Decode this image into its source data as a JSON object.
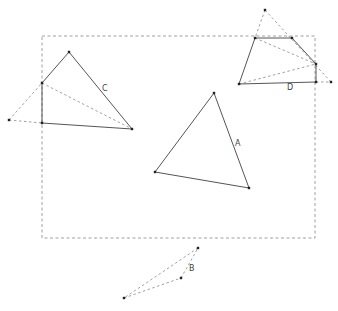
{
  "diagram": {
    "frame": {
      "x": 42,
      "y": 36,
      "width": 273,
      "height": 202
    },
    "shapes": [
      {
        "id": "A",
        "label": "A",
        "label_pos": [
          235,
          146
        ],
        "solid_edges": [
          [
            [
              214,
              93
            ],
            [
              155,
              172
            ]
          ],
          [
            [
              155,
              172
            ],
            [
              249,
              188
            ]
          ],
          [
            [
              249,
              188
            ],
            [
              214,
              93
            ]
          ]
        ],
        "dashed_edges": [],
        "points": [
          [
            214,
            93
          ],
          [
            155,
            172
          ],
          [
            249,
            188
          ]
        ]
      },
      {
        "id": "B",
        "label": "B",
        "label_pos": [
          189,
          271
        ],
        "solid_edges": [],
        "dashed_edges": [
          [
            [
              198,
              248
            ],
            [
              124,
              298
            ]
          ],
          [
            [
              124,
              298
            ],
            [
              181,
              278
            ]
          ],
          [
            [
              181,
              278
            ],
            [
              198,
              248
            ]
          ]
        ],
        "points": [
          [
            198,
            248
          ],
          [
            181,
            278
          ],
          [
            124,
            298
          ]
        ]
      },
      {
        "id": "C",
        "label": "C",
        "label_pos": [
          102,
          91
        ],
        "solid_edges": [
          [
            [
              42,
              83
            ],
            [
              69,
              52
            ]
          ],
          [
            [
              69,
              52
            ],
            [
              132,
              129
            ]
          ],
          [
            [
              132,
              129
            ],
            [
              42,
              123
            ]
          ],
          [
            [
              42,
              123
            ],
            [
              42,
              83
            ]
          ]
        ],
        "dashed_edges": [
          [
            [
              9,
              120
            ],
            [
              42,
              83
            ]
          ],
          [
            [
              9,
              120
            ],
            [
              42,
              123
            ]
          ],
          [
            [
              42,
              83
            ],
            [
              132,
              129
            ]
          ]
        ],
        "points": [
          [
            69,
            52
          ],
          [
            42,
            83
          ],
          [
            42,
            123
          ],
          [
            132,
            129
          ],
          [
            9,
            120
          ]
        ]
      },
      {
        "id": "D",
        "label": "D",
        "label_pos": [
          287,
          90
        ],
        "solid_edges": [
          [
            [
              255,
              38
            ],
            [
              292,
              38
            ]
          ],
          [
            [
              292,
              38
            ],
            [
              316,
              64
            ]
          ],
          [
            [
              316,
              64
            ],
            [
              316,
              82
            ]
          ],
          [
            [
              316,
              82
            ],
            [
              239,
              84
            ]
          ],
          [
            [
              239,
              84
            ],
            [
              255,
              38
            ]
          ]
        ],
        "dashed_edges": [
          [
            [
              265,
              10
            ],
            [
              255,
              38
            ]
          ],
          [
            [
              265,
              10
            ],
            [
              331,
              82
            ]
          ],
          [
            [
              255,
              38
            ],
            [
              316,
              64
            ]
          ],
          [
            [
              239,
              84
            ],
            [
              316,
              64
            ]
          ],
          [
            [
              316,
              82
            ],
            [
              331,
              82
            ]
          ]
        ],
        "points": [
          [
            265,
            10
          ],
          [
            255,
            38
          ],
          [
            292,
            38
          ],
          [
            316,
            64
          ],
          [
            316,
            82
          ],
          [
            331,
            82
          ],
          [
            239,
            84
          ]
        ]
      }
    ]
  }
}
